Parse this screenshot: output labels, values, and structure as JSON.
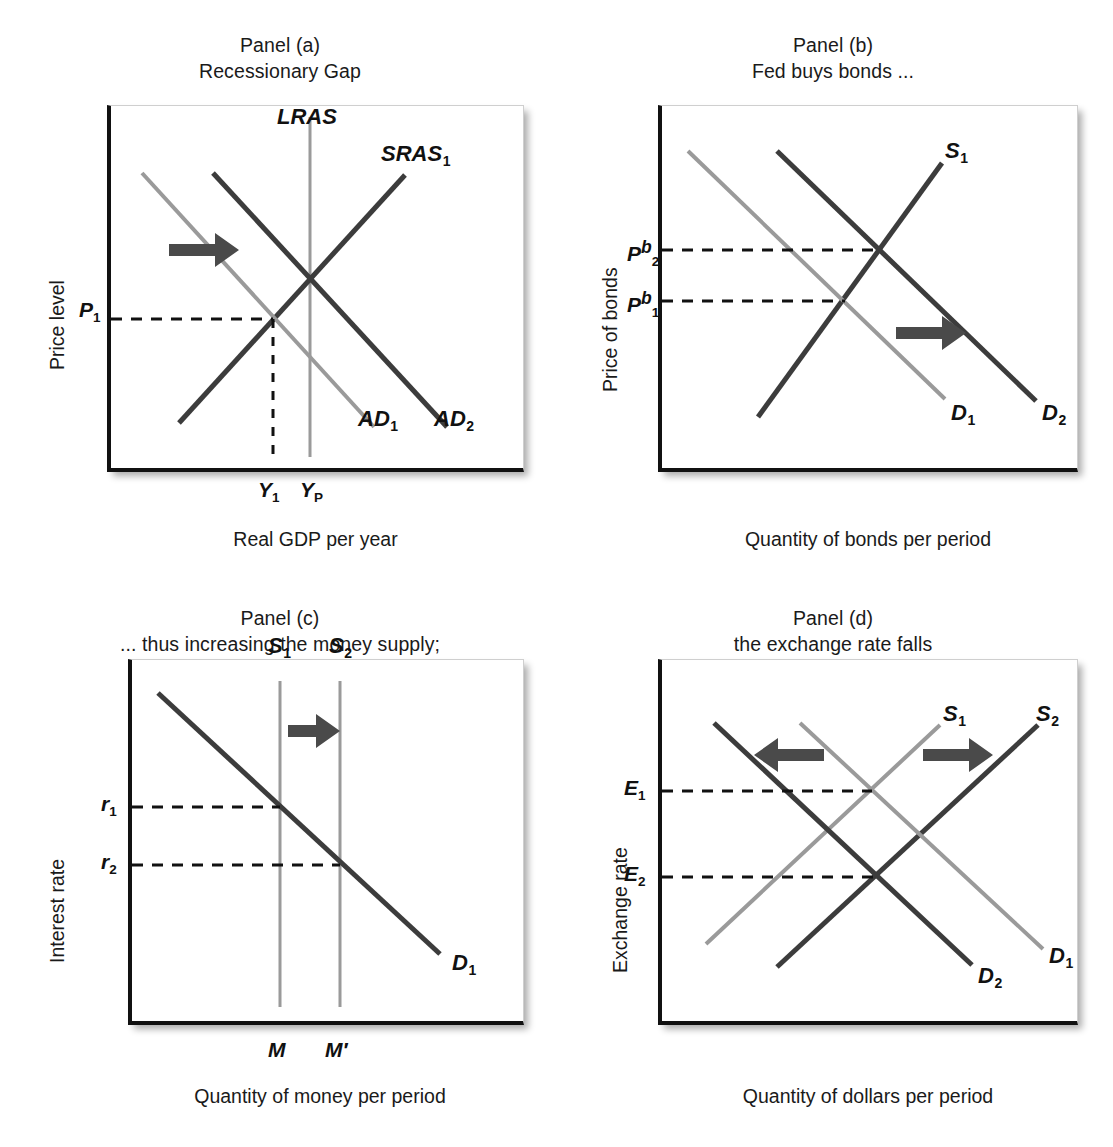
{
  "figure": {
    "kind": "four-panel economics diagram",
    "accent_dark": "#3c3c3c",
    "accent_light": "#9a9a9a",
    "axis_color": "#111111"
  },
  "panels": [
    {
      "id": "a",
      "title_line1": "Panel (a)",
      "title_line2": "Recessionary Gap",
      "ylabel": "Price level",
      "xlabel": "Real GDP per year",
      "curve_labels": [
        "LRAS",
        "SRAS",
        "AD",
        "AD"
      ],
      "curves": [
        {
          "name": "LRAS",
          "label": "LRAS",
          "sub": "",
          "tone": "light",
          "kind": "vertical"
        },
        {
          "name": "SRAS1",
          "label": "SRAS",
          "sub": "1",
          "tone": "dark",
          "kind": "upward"
        },
        {
          "name": "AD1",
          "label": "AD",
          "sub": "1",
          "tone": "light",
          "kind": "downward"
        },
        {
          "name": "AD2",
          "label": "AD",
          "sub": "2",
          "tone": "dark",
          "kind": "downward"
        }
      ],
      "y_ticks": [
        {
          "label": "P",
          "sub": "1"
        }
      ],
      "x_ticks": [
        {
          "label": "Y",
          "sub": "1"
        },
        {
          "label": "Y",
          "sub": "P"
        }
      ],
      "arrows": [
        {
          "direction": "right"
        }
      ]
    },
    {
      "id": "b",
      "title_line1": "Panel (b)",
      "title_line2": "Fed buys bonds ...",
      "ylabel": "Price of bonds",
      "xlabel": "Quantity of bonds per period",
      "curves": [
        {
          "name": "S1",
          "label": "S",
          "sub": "1",
          "tone": "dark",
          "kind": "upward"
        },
        {
          "name": "D1",
          "label": "D",
          "sub": "1",
          "tone": "light",
          "kind": "downward"
        },
        {
          "name": "D2",
          "label": "D",
          "sub": "2",
          "tone": "dark",
          "kind": "downward"
        }
      ],
      "y_ticks": [
        {
          "label": "P",
          "sub": "2",
          "sup": "b"
        },
        {
          "label": "P",
          "sub": "1",
          "sup": "b"
        }
      ],
      "x_ticks": [],
      "arrows": [
        {
          "direction": "right"
        }
      ]
    },
    {
      "id": "c",
      "title_line1": "Panel (c)",
      "title_line2": "... thus increasing the money supply;",
      "ylabel": "Interest rate",
      "xlabel": "Quantity of money per period",
      "curves": [
        {
          "name": "S1",
          "label": "S",
          "sub": "1",
          "tone": "light",
          "kind": "vertical"
        },
        {
          "name": "S2",
          "label": "S",
          "sub": "2",
          "tone": "light",
          "kind": "vertical"
        },
        {
          "name": "D1",
          "label": "D",
          "sub": "1",
          "tone": "dark",
          "kind": "downward"
        }
      ],
      "y_ticks": [
        {
          "label": "r",
          "sub": "1"
        },
        {
          "label": "r",
          "sub": "2"
        }
      ],
      "x_ticks": [
        {
          "label": "M",
          "sub": ""
        },
        {
          "label": "M′",
          "sub": ""
        }
      ],
      "arrows": [
        {
          "direction": "right"
        }
      ]
    },
    {
      "id": "d",
      "title_line1": "Panel (d)",
      "title_line2": "the exchange rate falls",
      "ylabel": "Exchange rate",
      "xlabel": "Quantity of dollars per period",
      "curves": [
        {
          "name": "S1",
          "label": "S",
          "sub": "1",
          "tone": "light",
          "kind": "upward"
        },
        {
          "name": "S2",
          "label": "S",
          "sub": "2",
          "tone": "dark",
          "kind": "upward"
        },
        {
          "name": "D1",
          "label": "D",
          "sub": "1",
          "tone": "light",
          "kind": "downward"
        },
        {
          "name": "D2",
          "label": "D",
          "sub": "2",
          "tone": "dark",
          "kind": "downward"
        }
      ],
      "y_ticks": [
        {
          "label": "E",
          "sub": "1"
        },
        {
          "label": "E",
          "sub": "2"
        }
      ],
      "x_ticks": [],
      "arrows": [
        {
          "direction": "left"
        },
        {
          "direction": "right"
        }
      ]
    }
  ],
  "labels": {
    "a": {
      "title1": "Panel (a)",
      "title2": "Recessionary Gap",
      "y_axis": "Price level",
      "x_axis": "Real GDP per year",
      "lras": "LRAS",
      "sras": "SRAS",
      "sras_sub": "1",
      "ad1": "AD",
      "ad1_sub": "1",
      "ad2": "AD",
      "ad2_sub": "2",
      "p1": "P",
      "p1_sub": "1",
      "y1": "Y",
      "y1_sub": "1",
      "yp": "Y",
      "yp_sub": "P"
    },
    "b": {
      "title1": "Panel (b)",
      "title2": "Fed buys bonds ...",
      "y_axis": "Price of bonds",
      "x_axis": "Quantity of bonds per period",
      "s1": "S",
      "s1_sub": "1",
      "d1": "D",
      "d1_sub": "1",
      "d2": "D",
      "d2_sub": "2",
      "p2b": "P",
      "p2b_sub": "2",
      "p2b_sup": "b",
      "p1b": "P",
      "p1b_sub": "1",
      "p1b_sup": "b"
    },
    "c": {
      "title1": "Panel (c)",
      "title2": "... thus increasing the money supply;",
      "y_axis": "Interest rate",
      "x_axis": "Quantity of money per period",
      "s1": "S",
      "s1_sub": "1",
      "s2": "S",
      "s2_sub": "2",
      "d1": "D",
      "d1_sub": "1",
      "r1": "r",
      "r1_sub": "1",
      "r2": "r",
      "r2_sub": "2",
      "m": "M",
      "mprime": "M′"
    },
    "d": {
      "title1": "Panel (d)",
      "title2": "the exchange rate falls",
      "y_axis": "Exchange rate",
      "x_axis": "Quantity of dollars per period",
      "s1": "S",
      "s1_sub": "1",
      "s2": "S",
      "s2_sub": "2",
      "d1": "D",
      "d1_sub": "1",
      "d2": "D",
      "d2_sub": "2",
      "e1": "E",
      "e1_sub": "1",
      "e2": "E",
      "e2_sub": "2"
    }
  }
}
